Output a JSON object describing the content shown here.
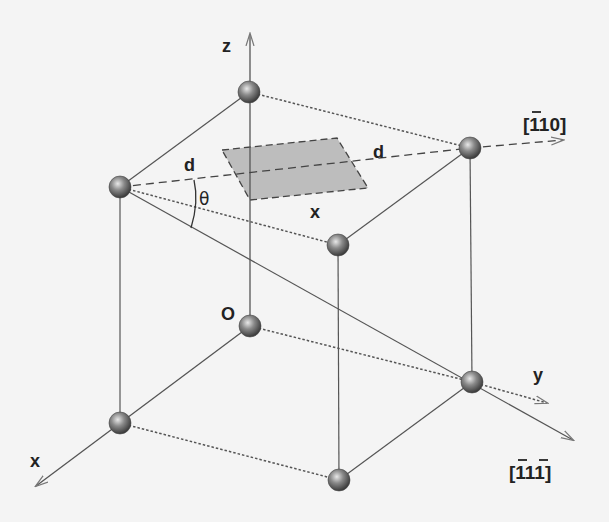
{
  "diagram": {
    "type": "crystal-lattice-cube",
    "background": "#f4f4f4",
    "line_color": "#555555",
    "plane_fill": "#b8b8b8",
    "atom_color": "#7a7a7a",
    "labels": {
      "z_axis": "z",
      "y_axis": "y",
      "x_axis": "x",
      "origin": "O",
      "direction_110": "[110]",
      "direction_111": "[111]",
      "d_left": "d",
      "d_right": "d",
      "x_plane": "x",
      "theta": "θ"
    },
    "atoms": [
      {
        "id": "top-back",
        "x": 249,
        "y": 92
      },
      {
        "id": "top-left",
        "x": 120,
        "y": 187
      },
      {
        "id": "top-right",
        "x": 470,
        "y": 148
      },
      {
        "id": "top-front",
        "x": 338,
        "y": 245
      },
      {
        "id": "origin",
        "x": 250,
        "y": 326
      },
      {
        "id": "bottom-right",
        "x": 472,
        "y": 382
      },
      {
        "id": "bottom-left",
        "x": 120,
        "y": 423
      },
      {
        "id": "bottom-front",
        "x": 339,
        "y": 480
      }
    ]
  }
}
